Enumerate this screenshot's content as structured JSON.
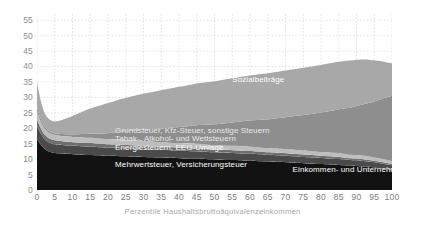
{
  "chart_data": {
    "type": "area",
    "stacked": true,
    "title": "",
    "xlabel": "Perzentile Haushaltsbruttoäquivalenzeinkommen",
    "ylabel": "",
    "xlim": [
      0,
      100
    ],
    "ylim": [
      0,
      57
    ],
    "yticks": [
      0,
      5,
      10,
      15,
      20,
      25,
      30,
      35,
      40,
      45,
      50,
      55
    ],
    "xticks": [
      0,
      5,
      10,
      15,
      20,
      25,
      30,
      35,
      40,
      45,
      50,
      55,
      60,
      65,
      70,
      75,
      80,
      85,
      90,
      95,
      100
    ],
    "grid": true,
    "legend_position": "inline-annotations",
    "x": [
      0,
      1,
      2,
      3,
      4,
      5,
      7,
      10,
      15,
      20,
      25,
      30,
      35,
      40,
      45,
      50,
      55,
      60,
      65,
      70,
      75,
      80,
      85,
      88,
      90,
      93,
      95,
      97,
      99,
      100
    ],
    "series": [
      {
        "name": "Mehrwertsteuer, Versicherungsteuer",
        "color": "#121212",
        "values": [
          16.5,
          14.8,
          13.4,
          12.6,
          12.2,
          12.0,
          11.8,
          11.6,
          11.3,
          11.1,
          10.9,
          10.7,
          10.5,
          10.3,
          10.1,
          9.9,
          9.7,
          9.5,
          9.2,
          9.0,
          8.7,
          8.4,
          8.1,
          7.9,
          7.8,
          7.5,
          7.3,
          7.0,
          6.7,
          6.5
        ]
      },
      {
        "name": "Energiesteuern, EEG-Umlage",
        "color": "#4a4a4a",
        "values": [
          4.2,
          3.6,
          3.2,
          3.0,
          2.9,
          2.8,
          2.8,
          2.7,
          2.7,
          2.6,
          2.6,
          2.5,
          2.5,
          2.4,
          2.4,
          2.3,
          2.3,
          2.2,
          2.2,
          2.1,
          2.0,
          2.0,
          1.9,
          1.8,
          1.8,
          1.7,
          1.7,
          1.6,
          1.5,
          1.5
        ]
      },
      {
        "name": "Tabak-, Alkohol- und Wettsteuern",
        "color": "#6e6e6e",
        "values": [
          2.1,
          1.7,
          1.5,
          1.4,
          1.3,
          1.3,
          1.2,
          1.2,
          1.2,
          1.1,
          1.1,
          1.1,
          1.0,
          1.0,
          1.0,
          0.9,
          0.9,
          0.9,
          0.8,
          0.8,
          0.8,
          0.7,
          0.7,
          0.6,
          0.6,
          0.6,
          0.5,
          0.5,
          0.5,
          0.4
        ]
      },
      {
        "name": "Grundsteuer, Kfz-Steuer, sonstige Steuern",
        "color": "#bdbdbd",
        "values": [
          2.6,
          2.2,
          2.0,
          1.9,
          1.8,
          1.8,
          1.7,
          1.7,
          1.7,
          1.6,
          1.6,
          1.6,
          1.5,
          1.5,
          1.5,
          1.4,
          1.4,
          1.4,
          1.3,
          1.3,
          1.3,
          1.2,
          1.2,
          1.1,
          1.1,
          1.1,
          1.0,
          1.0,
          0.9,
          0.9
        ]
      },
      {
        "name": "Einkommen- und Unternehmensteuern",
        "color": "#8e8e8e",
        "values": [
          1.4,
          0.9,
          0.6,
          0.5,
          0.5,
          0.5,
          0.6,
          0.8,
          1.3,
          2.0,
          2.8,
          3.6,
          4.4,
          5.2,
          6.0,
          6.8,
          7.6,
          8.5,
          9.4,
          10.4,
          11.5,
          12.8,
          14.2,
          15.2,
          15.9,
          17.2,
          18.2,
          19.4,
          20.6,
          21.2
        ]
      },
      {
        "name": "Sozialbeiträge",
        "color": "#a8a8a8",
        "values": [
          8.2,
          6.0,
          4.6,
          4.0,
          3.8,
          3.8,
          4.6,
          6.0,
          8.2,
          9.8,
          10.9,
          11.7,
          12.4,
          13.0,
          13.5,
          13.9,
          14.3,
          14.6,
          14.9,
          15.1,
          15.3,
          15.4,
          15.4,
          15.3,
          15.0,
          14.2,
          13.3,
          12.2,
          11.0,
          10.5
        ]
      }
    ],
    "totals_note": {
      "p0": 35.0,
      "p5": 22.2,
      "min_region": "um Perzentil 3-6",
      "peak": 49.9,
      "peak_at": 88,
      "p100": 41.0
    },
    "annotations": [
      {
        "text": "Sozialbeiträge",
        "x": 55,
        "y": 35.5,
        "style": "light"
      },
      {
        "text": "Grundsteuer, Kfz-Steuer, sonstige Steuern",
        "x": 22,
        "y": 19.2,
        "style": "mid"
      },
      {
        "text": "Tabak-, Alkohol- und Wettsteuern",
        "x": 22,
        "y": 16.4,
        "style": "mid"
      },
      {
        "text": "Energiesteuern, EEG-Umlage",
        "x": 22,
        "y": 13.6,
        "style": "light"
      },
      {
        "text": "Mehrwertsteuer, Versicherungsteuer",
        "x": 22,
        "y": 8.2,
        "style": "light"
      },
      {
        "text": "Einkommen- und Unternehmensteuern",
        "x": 72,
        "y": 6.5,
        "style": "light"
      }
    ],
    "colors": {
      "grid": "#d9d9d9",
      "tick_text": "#8d8d8d",
      "axis_title": "#a8a8a8",
      "background": "#ffffff"
    }
  }
}
